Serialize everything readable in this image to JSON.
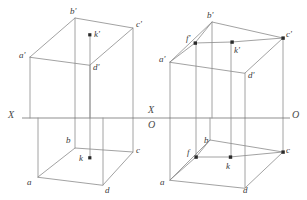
{
  "figure": {
    "background_color": "#ffffff",
    "line_color": "#8a8a8a",
    "axis_color": "#8f8f8f",
    "dot_color": "#2a2a2a",
    "width": 307,
    "height": 200,
    "axis": {
      "y": 118,
      "x_start": 22,
      "x_end": 290,
      "labels": {
        "left_x": "X",
        "mid_x": "X",
        "mid_o": "O",
        "right_o": "O"
      }
    },
    "panels": [
      {
        "name": "left-projection",
        "vertex_labels": {
          "a_prime": "a'",
          "b_prime": "b'",
          "c_prime": "c'",
          "d_prime": "d'",
          "k_prime": "k'",
          "a": "a",
          "b": "b",
          "c": "c",
          "d": "d",
          "k": "k"
        }
      },
      {
        "name": "right-projection",
        "vertex_labels": {
          "a_prime": "a'",
          "b_prime": "b'",
          "c_prime": "c'",
          "d_prime": "d'",
          "k_prime": "k'",
          "f_prime": "f'",
          "a": "a",
          "b": "b",
          "c": "c",
          "d": "d",
          "k": "k",
          "f": "f"
        }
      }
    ]
  }
}
